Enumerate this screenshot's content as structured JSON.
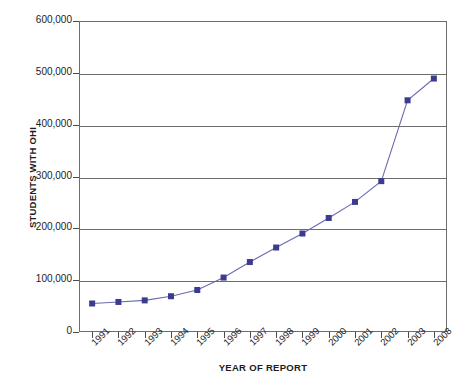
{
  "chart_data": {
    "type": "line",
    "title": "",
    "xlabel": "YEAR OF REPORT",
    "ylabel": "STUDENTS WITH OHI",
    "categories": [
      "1991",
      "1992",
      "1993",
      "1994",
      "1995",
      "1996",
      "1997",
      "1998",
      "1999",
      "2000",
      "2001",
      "2002",
      "2003",
      "2008"
    ],
    "values": [
      55000,
      58000,
      61000,
      69000,
      81000,
      105000,
      135000,
      163000,
      190000,
      220000,
      251000,
      291000,
      447000,
      489000
    ],
    "ylim": [
      0,
      600000
    ],
    "y_ticks": [
      0,
      100000,
      200000,
      300000,
      400000,
      500000,
      600000
    ],
    "y_tick_labels": [
      "0",
      "100,000",
      "200,000",
      "300,000",
      "400,000",
      "500,000",
      "600,000"
    ],
    "grid": "horizontal",
    "legend": "none",
    "series_color": "#3b3b8f",
    "marker": "square",
    "gridline_color": "#6d6d6d"
  },
  "axes": {
    "y_title": "STUDENTS WITH OHI",
    "x_title": "YEAR OF REPORT"
  }
}
